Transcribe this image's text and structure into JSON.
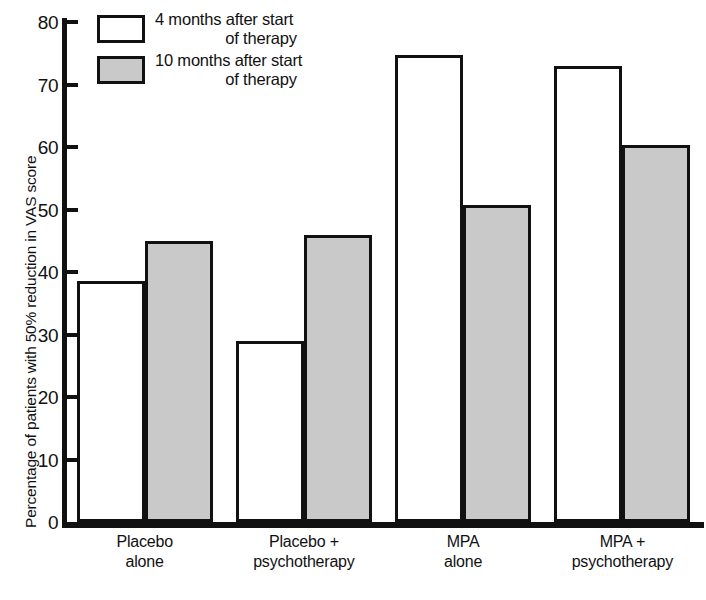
{
  "chart_data": {
    "type": "bar",
    "title": "",
    "xlabel": "",
    "ylabel": "Percentage of patients with 50% reduction in VAS score",
    "ylim": [
      0,
      80
    ],
    "yticks": [
      0,
      10,
      20,
      30,
      40,
      50,
      60,
      70,
      80
    ],
    "grid": false,
    "legend_position": "top-left",
    "categories": [
      "Placebo alone",
      "Placebo + psychotherapy",
      "MPA alone",
      "MPA + psychotherapy"
    ],
    "category_lines": [
      {
        "line1": "Placebo",
        "line2": "alone"
      },
      {
        "line1": "Placebo +",
        "line2": "psychotherapy"
      },
      {
        "line1": "MPA",
        "line2": "alone"
      },
      {
        "line1": "MPA +",
        "line2": "psychotherapy"
      }
    ],
    "series": [
      {
        "name": "4 months after start of therapy",
        "fill": "#ffffff",
        "values": [
          38.5,
          29.0,
          74.8,
          73.0
        ]
      },
      {
        "name": "10 months after start of therapy",
        "fill": "#c9c9c9",
        "values": [
          45.0,
          46.0,
          50.8,
          60.4
        ]
      }
    ]
  },
  "legend": {
    "entries": [
      {
        "swatch": "white",
        "line1": "4 months after start",
        "line2": "of therapy"
      },
      {
        "swatch": "gray",
        "line1": "10 months after start",
        "line2": "of therapy"
      }
    ]
  },
  "colors": {
    "axis": "#111111",
    "series_1_fill": "#ffffff",
    "series_2_fill": "#c9c9c9",
    "background": "#ffffff"
  },
  "caption": ""
}
